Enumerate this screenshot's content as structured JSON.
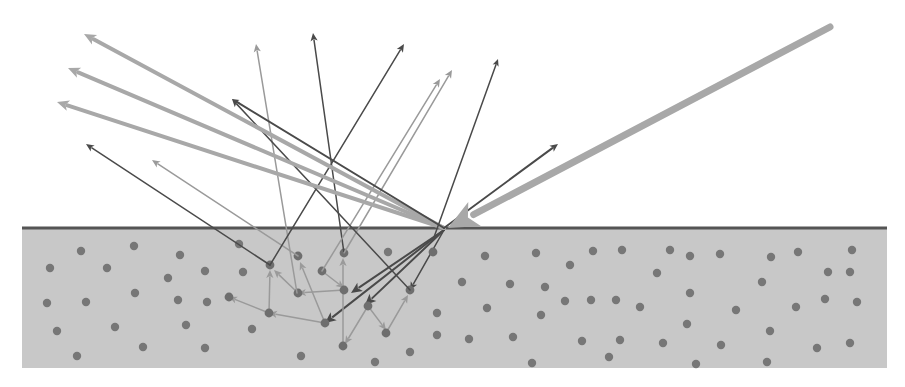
{
  "diagram": {
    "colors": {
      "background": "#ffffff",
      "substrate": "#c8c8c8",
      "surface_line": "#555555",
      "particle": "#777777",
      "ray_light": "#a8a8a8",
      "ray_medium": "#9a9a9a",
      "ray_dark": "#4a4a4a",
      "incident": "#a8a8a8"
    },
    "substrate": {
      "x": 22,
      "y": 228,
      "width": 865,
      "height": 140
    },
    "surface_line": {
      "x1": 22,
      "y1": 228,
      "x2": 887,
      "y2": 228
    },
    "incident_ray": {
      "from": [
        830,
        27
      ],
      "to": [
        448,
        228
      ],
      "width": 7
    },
    "entry_point": [
      444,
      228
    ],
    "specular_rays": [
      {
        "from": [
          444,
          228
        ],
        "to": [
          84,
          34
        ],
        "color": "ray_light",
        "width": 4,
        "head": 12
      },
      {
        "from": [
          444,
          228
        ],
        "to": [
          68,
          68
        ],
        "color": "ray_light",
        "width": 4,
        "head": 12
      },
      {
        "from": [
          444,
          228
        ],
        "to": [
          57,
          102
        ],
        "color": "ray_light",
        "width": 4,
        "head": 12
      },
      {
        "from": [
          444,
          228
        ],
        "to": [
          558,
          144
        ],
        "color": "ray_dark",
        "width": 2,
        "head": 8
      },
      {
        "from": [
          444,
          228
        ],
        "to": [
          232,
          99
        ],
        "color": "ray_dark",
        "width": 2,
        "head": 7
      },
      {
        "from": [
          433,
          240
        ],
        "to": [
          498,
          59
        ],
        "color": "ray_dark",
        "width": 1.5,
        "head": 7
      }
    ],
    "emerging_rays": [
      {
        "from": [
          270,
          265
        ],
        "to": [
          86,
          144
        ],
        "color": "ray_dark",
        "width": 1.5
      },
      {
        "from": [
          298,
          256
        ],
        "to": [
          152,
          160
        ],
        "color": "ray_medium",
        "width": 1.5
      },
      {
        "from": [
          297,
          293
        ],
        "to": [
          256,
          44
        ],
        "color": "ray_medium",
        "width": 1.5
      },
      {
        "from": [
          344,
          253
        ],
        "to": [
          313,
          33
        ],
        "color": "ray_dark",
        "width": 1.5
      },
      {
        "from": [
          270,
          265
        ],
        "to": [
          404,
          44
        ],
        "color": "ray_dark",
        "width": 1.5
      },
      {
        "from": [
          322,
          271
        ],
        "to": [
          440,
          79
        ],
        "color": "ray_medium",
        "width": 1.5
      },
      {
        "from": [
          344,
          253
        ],
        "to": [
          452,
          70
        ],
        "color": "ray_medium",
        "width": 1.5
      },
      {
        "from": [
          410,
          290
        ],
        "to": [
          232,
          99
        ],
        "color": "ray_dark",
        "width": 1.5
      }
    ],
    "internal_rays": [
      {
        "from": [
          444,
          230
        ],
        "to": [
          351,
          293
        ],
        "color": "ray_dark",
        "width": 2
      },
      {
        "from": [
          444,
          230
        ],
        "to": [
          365,
          305
        ],
        "color": "ray_dark",
        "width": 2
      },
      {
        "from": [
          444,
          230
        ],
        "to": [
          325,
          323
        ],
        "color": "ray_dark",
        "width": 2
      },
      {
        "from": [
          444,
          230
        ],
        "to": [
          410,
          290
        ],
        "color": "ray_dark",
        "width": 1.5
      },
      {
        "from": [
          344,
          290
        ],
        "to": [
          298,
          293
        ],
        "color": "ray_medium",
        "width": 1.5
      },
      {
        "from": [
          325,
          323
        ],
        "to": [
          269,
          313
        ],
        "color": "ray_medium",
        "width": 1.5
      },
      {
        "from": [
          269,
          313
        ],
        "to": [
          229,
          297
        ],
        "color": "ray_medium",
        "width": 1.5
      },
      {
        "from": [
          269,
          313
        ],
        "to": [
          270,
          270
        ],
        "color": "ray_medium",
        "width": 1.5
      },
      {
        "from": [
          298,
          293
        ],
        "to": [
          274,
          270
        ],
        "color": "ray_medium",
        "width": 1.5
      },
      {
        "from": [
          325,
          323
        ],
        "to": [
          300,
          262
        ],
        "color": "ray_medium",
        "width": 1.5
      },
      {
        "from": [
          343,
          346
        ],
        "to": [
          343,
          258
        ],
        "color": "ray_medium",
        "width": 1.5
      },
      {
        "from": [
          322,
          271
        ],
        "to": [
          344,
          288
        ],
        "color": "ray_medium",
        "width": 1.5
      },
      {
        "from": [
          368,
          306
        ],
        "to": [
          345,
          344
        ],
        "color": "ray_medium",
        "width": 1.5
      },
      {
        "from": [
          368,
          306
        ],
        "to": [
          386,
          330
        ],
        "color": "ray_medium",
        "width": 1.5
      },
      {
        "from": [
          386,
          333
        ],
        "to": [
          408,
          295
        ],
        "color": "ray_medium",
        "width": 1.5
      }
    ],
    "network_particles": [
      [
        270,
        265
      ],
      [
        298,
        256
      ],
      [
        344,
        253
      ],
      [
        322,
        271
      ],
      [
        298,
        293
      ],
      [
        344,
        290
      ],
      [
        269,
        313
      ],
      [
        325,
        323
      ],
      [
        368,
        306
      ],
      [
        386,
        333
      ],
      [
        410,
        290
      ],
      [
        343,
        346
      ],
      [
        229,
        297
      ],
      [
        433,
        252
      ]
    ],
    "particles": [
      [
        81,
        251
      ],
      [
        134,
        246
      ],
      [
        50,
        268
      ],
      [
        107,
        268
      ],
      [
        180,
        255
      ],
      [
        168,
        278
      ],
      [
        47,
        303
      ],
      [
        86,
        302
      ],
      [
        135,
        293
      ],
      [
        178,
        300
      ],
      [
        57,
        331
      ],
      [
        115,
        327
      ],
      [
        77,
        356
      ],
      [
        143,
        347
      ],
      [
        205,
        348
      ],
      [
        205,
        271
      ],
      [
        207,
        302
      ],
      [
        186,
        325
      ],
      [
        239,
        244
      ],
      [
        243,
        272
      ],
      [
        252,
        329
      ],
      [
        301,
        356
      ],
      [
        375,
        362
      ],
      [
        410,
        352
      ],
      [
        388,
        252
      ],
      [
        485,
        256
      ],
      [
        536,
        253
      ],
      [
        570,
        265
      ],
      [
        593,
        251
      ],
      [
        622,
        250
      ],
      [
        670,
        250
      ],
      [
        462,
        282
      ],
      [
        510,
        284
      ],
      [
        545,
        287
      ],
      [
        565,
        301
      ],
      [
        591,
        300
      ],
      [
        616,
        300
      ],
      [
        657,
        273
      ],
      [
        640,
        307
      ],
      [
        487,
        308
      ],
      [
        541,
        315
      ],
      [
        582,
        341
      ],
      [
        620,
        340
      ],
      [
        469,
        339
      ],
      [
        513,
        337
      ],
      [
        532,
        363
      ],
      [
        609,
        357
      ],
      [
        690,
        256
      ],
      [
        720,
        254
      ],
      [
        771,
        257
      ],
      [
        798,
        252
      ],
      [
        828,
        272
      ],
      [
        852,
        250
      ],
      [
        762,
        282
      ],
      [
        850,
        272
      ],
      [
        690,
        293
      ],
      [
        736,
        310
      ],
      [
        796,
        307
      ],
      [
        825,
        299
      ],
      [
        857,
        302
      ],
      [
        687,
        324
      ],
      [
        770,
        331
      ],
      [
        721,
        345
      ],
      [
        663,
        343
      ],
      [
        817,
        348
      ],
      [
        850,
        343
      ],
      [
        767,
        362
      ],
      [
        696,
        364
      ],
      [
        437,
        313
      ],
      [
        437,
        335
      ]
    ]
  }
}
